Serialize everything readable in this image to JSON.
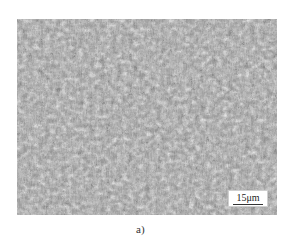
{
  "figure": {
    "scale_bar": {
      "label": "15μm"
    },
    "caption": "a)",
    "colors": {
      "background": "#ffffff",
      "grain_dark": "#2a2a2a",
      "grain_mid": "#8a8a8a",
      "grain_light": "#e8e8e8"
    }
  }
}
